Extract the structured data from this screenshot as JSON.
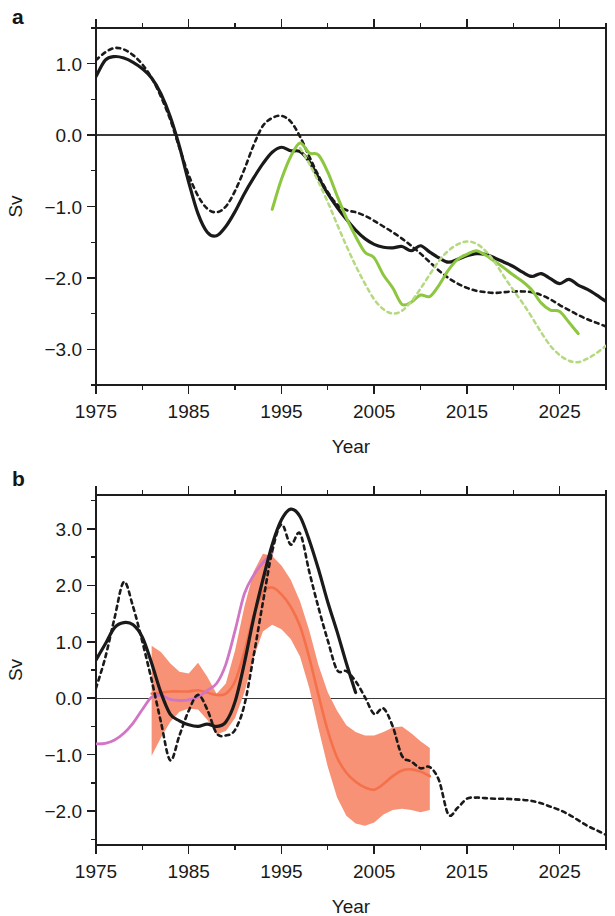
{
  "figure": {
    "panels": [
      {
        "letter": "a",
        "ylabel": "Sv",
        "xlabel": "Year"
      },
      {
        "letter": "b",
        "ylabel": "Sv",
        "xlabel": "Year"
      }
    ]
  },
  "colors": {
    "black": "#1a1a1a",
    "green": "#8DC63F",
    "green_dashed": "#B5D97F",
    "salmon_band": "#F79277",
    "salmon_line": "#F4714C",
    "orchid": "#D176C4",
    "axis": "#1d1d1d"
  },
  "chart_data": [
    {
      "type": "line",
      "panel": "a",
      "title": "",
      "xlabel": "Year",
      "ylabel": "Sv",
      "xlim": [
        1975,
        2030
      ],
      "ylim": [
        -3.5,
        1.5
      ],
      "xticks": [
        1975,
        1985,
        1995,
        2005,
        2015,
        2025
      ],
      "xticklabels": [
        "1975",
        "1985",
        "1995",
        "2005",
        "2015",
        "2025"
      ],
      "xminorticks": [
        1980,
        1990,
        2000,
        2010,
        2020,
        2030
      ],
      "yticks": [
        1.0,
        0.0,
        -1.0,
        -2.0,
        -3.0
      ],
      "yticklabels": [
        "1.0",
        "0.0",
        "-1.0",
        "-2.0",
        "-3.0"
      ],
      "yminorticks": [
        1.5,
        0.5,
        -0.5,
        -1.5,
        -2.5,
        -3.5
      ],
      "grid": false,
      "zero_line": 0.0,
      "legend": "none",
      "series": [
        {
          "name": "black-solid",
          "color": "#1a1a1a",
          "style": "solid",
          "width": 3.2,
          "x": [
            1975,
            1976,
            1977,
            1978,
            1979,
            1980,
            1981,
            1982,
            1983,
            1984,
            1985,
            1986,
            1987,
            1988,
            1989,
            1990,
            1991,
            1992,
            1993,
            1994,
            1995,
            1996,
            1997,
            1998,
            1999,
            2000,
            2001,
            2002,
            2003,
            2004,
            2005,
            2006,
            2007,
            2008,
            2009,
            2010,
            2011,
            2012,
            2013,
            2014,
            2015,
            2016,
            2017,
            2018,
            2019,
            2020,
            2021,
            2022,
            2023,
            2024,
            2025,
            2026,
            2027,
            2028,
            2029,
            2030
          ],
          "y": [
            0.82,
            1.05,
            1.1,
            1.08,
            1.02,
            0.93,
            0.8,
            0.58,
            0.26,
            -0.16,
            -0.66,
            -1.1,
            -1.36,
            -1.41,
            -1.28,
            -1.07,
            -0.82,
            -0.6,
            -0.4,
            -0.24,
            -0.17,
            -0.22,
            -0.23,
            -0.37,
            -0.6,
            -0.82,
            -1.01,
            -1.18,
            -1.33,
            -1.45,
            -1.53,
            -1.57,
            -1.58,
            -1.56,
            -1.62,
            -1.55,
            -1.64,
            -1.72,
            -1.78,
            -1.74,
            -1.69,
            -1.66,
            -1.67,
            -1.72,
            -1.78,
            -1.84,
            -1.92,
            -1.98,
            -1.94,
            -2.01,
            -2.08,
            -2.02,
            -2.1,
            -2.16,
            -2.24,
            -2.33
          ]
        },
        {
          "name": "black-dashed",
          "color": "#1a1a1a",
          "style": "dashed",
          "width": 2.6,
          "x": [
            1975,
            1976,
            1977,
            1978,
            1979,
            1980,
            1981,
            1982,
            1983,
            1984,
            1985,
            1986,
            1987,
            1988,
            1989,
            1990,
            1991,
            1992,
            1993,
            1994,
            1995,
            1996,
            1997,
            1998,
            1999,
            2000,
            2001,
            2002,
            2003,
            2004,
            2005,
            2006,
            2007,
            2008,
            2009,
            2010,
            2011,
            2012,
            2013,
            2014,
            2015,
            2016,
            2017,
            2018,
            2019,
            2020,
            2021,
            2022,
            2023,
            2024,
            2025,
            2026,
            2027,
            2028,
            2029,
            2030
          ],
          "y": [
            1.05,
            1.16,
            1.22,
            1.2,
            1.12,
            0.99,
            0.8,
            0.54,
            0.22,
            -0.18,
            -0.56,
            -0.85,
            -1.03,
            -1.08,
            -1.0,
            -0.78,
            -0.48,
            -0.14,
            0.13,
            0.24,
            0.27,
            0.19,
            -0.02,
            -0.3,
            -0.57,
            -0.8,
            -0.97,
            -1.05,
            -1.08,
            -1.13,
            -1.2,
            -1.28,
            -1.36,
            -1.45,
            -1.55,
            -1.66,
            -1.78,
            -1.9,
            -2.0,
            -2.08,
            -2.14,
            -2.18,
            -2.2,
            -2.21,
            -2.2,
            -2.19,
            -2.19,
            -2.2,
            -2.24,
            -2.3,
            -2.38,
            -2.45,
            -2.52,
            -2.58,
            -2.63,
            -2.68
          ]
        },
        {
          "name": "green-solid",
          "color": "#8DC63F",
          "style": "solid",
          "width": 3.0,
          "x": [
            1994,
            1995,
            1996,
            1997,
            1998,
            1999,
            2000,
            2001,
            2002,
            2003,
            2004,
            2005,
            2006,
            2007,
            2008,
            2009,
            2010,
            2011,
            2012,
            2013,
            2014,
            2015,
            2016,
            2017,
            2018,
            2019,
            2020,
            2021,
            2022,
            2023,
            2024,
            2025,
            2026,
            2027
          ],
          "y": [
            -1.04,
            -0.62,
            -0.3,
            -0.11,
            -0.25,
            -0.28,
            -0.52,
            -0.85,
            -1.16,
            -1.42,
            -1.64,
            -1.72,
            -1.96,
            -2.14,
            -2.37,
            -2.34,
            -2.24,
            -2.26,
            -2.1,
            -1.89,
            -1.74,
            -1.67,
            -1.62,
            -1.68,
            -1.77,
            -1.86,
            -1.96,
            -2.05,
            -2.17,
            -2.35,
            -2.45,
            -2.47,
            -2.62,
            -2.78
          ]
        },
        {
          "name": "green-dashed",
          "color": "#B5D97F",
          "style": "dashed",
          "width": 2.5,
          "x": [
            1997,
            1998,
            1999,
            2000,
            2001,
            2002,
            2003,
            2004,
            2005,
            2006,
            2007,
            2008,
            2009,
            2010,
            2011,
            2012,
            2013,
            2014,
            2015,
            2016,
            2017,
            2018,
            2019,
            2020,
            2021,
            2022,
            2023,
            2024,
            2025,
            2026,
            2027,
            2028,
            2029,
            2030
          ],
          "y": [
            -0.18,
            -0.4,
            -0.66,
            -0.94,
            -1.25,
            -1.55,
            -1.83,
            -2.08,
            -2.3,
            -2.44,
            -2.5,
            -2.46,
            -2.33,
            -2.15,
            -1.95,
            -1.76,
            -1.62,
            -1.53,
            -1.49,
            -1.52,
            -1.62,
            -1.78,
            -1.98,
            -2.17,
            -2.35,
            -2.55,
            -2.76,
            -2.95,
            -3.08,
            -3.16,
            -3.18,
            -3.13,
            -3.05,
            -2.95
          ]
        }
      ]
    },
    {
      "type": "line",
      "panel": "b",
      "title": "",
      "xlabel": "Year",
      "ylabel": "Sv",
      "xlim": [
        1975,
        2030
      ],
      "ylim": [
        -2.6,
        3.6
      ],
      "xticks": [
        1975,
        1985,
        1995,
        2005,
        2015,
        2025
      ],
      "xticklabels": [
        "1975",
        "1985",
        "1995",
        "2005",
        "2015",
        "2025"
      ],
      "xminorticks": [
        1980,
        1990,
        2000,
        2010,
        2020,
        2030
      ],
      "yticks": [
        3.0,
        2.0,
        1.0,
        0.0,
        -1.0,
        -2.0
      ],
      "yticklabels": [
        "3.0",
        "2.0",
        "1.0",
        "0.0",
        "-1.0",
        "-2.0"
      ],
      "yminorticks": [
        3.5,
        2.5,
        1.5,
        0.5,
        -0.5,
        -1.5,
        -2.5
      ],
      "grid": false,
      "zero_line": 0.0,
      "legend": "none",
      "bands": [
        {
          "name": "salmon-uncertainty-band",
          "color": "#F79277",
          "opacity": 1,
          "x": [
            1981,
            1982,
            1983,
            1984,
            1985,
            1986,
            1987,
            1988,
            1989,
            1990,
            1991,
            1992,
            1993,
            1994,
            1995,
            1996,
            1997,
            1998,
            1999,
            2000,
            2001,
            2002,
            2003,
            2004,
            2005,
            2006,
            2007,
            2008,
            2009,
            2010,
            2011
          ],
          "upper": [
            0.93,
            0.82,
            0.62,
            0.47,
            0.44,
            0.63,
            0.38,
            0.08,
            0.26,
            0.85,
            1.62,
            2.24,
            2.56,
            2.52,
            2.35,
            2.1,
            1.72,
            1.2,
            0.58,
            0.1,
            -0.22,
            -0.48,
            -0.6,
            -0.66,
            -0.66,
            -0.6,
            -0.52,
            -0.5,
            -0.62,
            -0.76,
            -0.88
          ],
          "lower": [
            -1.02,
            -0.7,
            -0.42,
            -0.24,
            -0.18,
            -0.2,
            -0.38,
            -0.64,
            -0.58,
            -0.35,
            0.1,
            0.72,
            1.18,
            1.3,
            1.22,
            1.05,
            0.74,
            0.18,
            -0.54,
            -1.22,
            -1.76,
            -2.08,
            -2.22,
            -2.26,
            -2.2,
            -2.06,
            -1.98,
            -1.96,
            -1.98,
            -2.02,
            -1.98
          ]
        }
      ],
      "series": [
        {
          "name": "salmon-mean",
          "color": "#F4714C",
          "style": "solid",
          "width": 2.6,
          "x": [
            1981,
            1982,
            1983,
            1984,
            1985,
            1986,
            1987,
            1988,
            1989,
            1990,
            1991,
            1992,
            1993,
            1994,
            1995,
            1996,
            1997,
            1998,
            1999,
            2000,
            2001,
            2002,
            2003,
            2004,
            2005,
            2006,
            2007,
            2008,
            2009,
            2010,
            2011
          ],
          "y": [
            0.08,
            0.1,
            0.12,
            0.12,
            0.12,
            0.14,
            0.1,
            0.06,
            0.08,
            0.3,
            0.82,
            1.46,
            1.88,
            1.96,
            1.84,
            1.62,
            1.28,
            0.72,
            0.05,
            -0.58,
            -1.05,
            -1.32,
            -1.48,
            -1.58,
            -1.62,
            -1.52,
            -1.38,
            -1.28,
            -1.26,
            -1.3,
            -1.38
          ]
        },
        {
          "name": "orchid-solid",
          "color": "#D176C4",
          "style": "solid",
          "width": 2.8,
          "x": [
            1975,
            1976,
            1977,
            1978,
            1979,
            1980,
            1981,
            1982,
            1983,
            1984,
            1985,
            1986,
            1987,
            1988,
            1989,
            1990,
            1991,
            1992,
            1993,
            1994
          ],
          "y": [
            -0.81,
            -0.8,
            -0.74,
            -0.62,
            -0.44,
            -0.2,
            0.02,
            0.05,
            -0.02,
            -0.04,
            -0.03,
            0.02,
            0.14,
            0.26,
            0.6,
            1.2,
            1.85,
            2.18,
            2.4,
            2.58
          ]
        },
        {
          "name": "black-solid",
          "color": "#1a1a1a",
          "style": "solid",
          "width": 3.2,
          "x": [
            1975,
            1976,
            1977,
            1978,
            1979,
            1980,
            1981,
            1982,
            1983,
            1984,
            1985,
            1986,
            1987,
            1988,
            1989,
            1990,
            1991,
            1992,
            1993,
            1994,
            1995,
            1996,
            1997,
            1998,
            1999,
            2000,
            2001,
            2002,
            2003
          ],
          "y": [
            0.68,
            0.96,
            1.25,
            1.34,
            1.3,
            1.08,
            0.62,
            0.1,
            -0.28,
            -0.4,
            -0.47,
            -0.5,
            -0.46,
            -0.5,
            -0.42,
            -0.06,
            0.62,
            1.42,
            2.1,
            2.72,
            3.16,
            3.35,
            3.22,
            2.8,
            2.28,
            1.7,
            1.18,
            0.62,
            0.1
          ]
        },
        {
          "name": "black-dashed",
          "color": "#1a1a1a",
          "style": "dashed",
          "width": 2.6,
          "x": [
            1975,
            1976,
            1977,
            1978,
            1979,
            1980,
            1981,
            1982,
            1983,
            1984,
            1985,
            1986,
            1987,
            1988,
            1989,
            1990,
            1991,
            1992,
            1993,
            1994,
            1995,
            1996,
            1997,
            1998,
            1999,
            2000,
            2001,
            2002,
            2003,
            2004,
            2005,
            2006,
            2007,
            2008,
            2009,
            2010,
            2011,
            2012,
            2013,
            2014,
            2015,
            2016,
            2017,
            2018,
            2019,
            2020,
            2021,
            2022,
            2023,
            2024,
            2025,
            2026,
            2027,
            2028,
            2029,
            2030
          ],
          "y": [
            0.18,
            0.72,
            1.42,
            2.06,
            1.62,
            1.0,
            0.32,
            -0.42,
            -1.1,
            -0.66,
            -0.22,
            0.06,
            -0.2,
            -0.62,
            -0.66,
            -0.56,
            -0.12,
            0.75,
            1.7,
            2.6,
            3.08,
            2.72,
            2.92,
            2.24,
            1.6,
            1.02,
            0.5,
            0.48,
            0.3,
            0.02,
            -0.28,
            -0.18,
            -0.5,
            -1.02,
            -1.12,
            -1.24,
            -1.22,
            -1.46,
            -2.06,
            -1.94,
            -1.78,
            -1.76,
            -1.77,
            -1.78,
            -1.78,
            -1.79,
            -1.8,
            -1.82,
            -1.86,
            -1.92,
            -1.98,
            -2.06,
            -2.16,
            -2.26,
            -2.34,
            -2.42
          ]
        }
      ]
    }
  ]
}
